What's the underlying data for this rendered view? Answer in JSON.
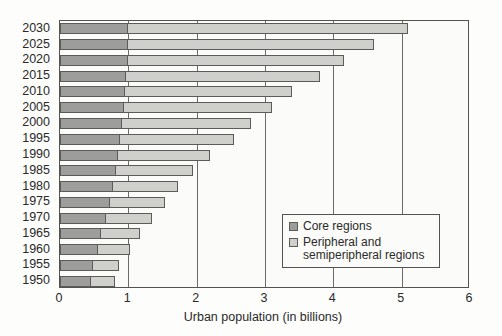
{
  "chart_data": {
    "type": "bar",
    "orientation": "horizontal",
    "stacked": true,
    "title": "",
    "xlabel": "Urban population (in billions)",
    "ylabel": "",
    "xlim": [
      0,
      6
    ],
    "xticks": [
      "0",
      "1",
      "2",
      "3",
      "4",
      "5",
      "6"
    ],
    "grid": true,
    "legend_position": "inside-lower-right",
    "categories": [
      "2030",
      "2025",
      "2020",
      "2015",
      "2010",
      "2005",
      "2000",
      "1995",
      "1990",
      "1985",
      "1980",
      "1975",
      "1970",
      "1965",
      "1960",
      "1955",
      "1950"
    ],
    "series": [
      {
        "name": "Core regions",
        "color": "#9d9d9b",
        "values": [
          1.0,
          1.0,
          0.99,
          0.97,
          0.95,
          0.93,
          0.9,
          0.88,
          0.85,
          0.82,
          0.78,
          0.73,
          0.67,
          0.6,
          0.55,
          0.48,
          0.45
        ]
      },
      {
        "name": "Peripheral and semiperipheral regions",
        "color": "#cfcfcb",
        "values": [
          4.1,
          3.6,
          3.16,
          2.83,
          2.45,
          2.17,
          1.9,
          1.67,
          1.35,
          1.13,
          0.95,
          0.8,
          0.68,
          0.57,
          0.47,
          0.39,
          0.35
        ]
      }
    ],
    "totals": [
      5.1,
      4.6,
      4.15,
      3.8,
      3.4,
      3.1,
      2.8,
      2.55,
      2.2,
      1.95,
      1.73,
      1.53,
      1.35,
      1.17,
      1.02,
      0.87,
      0.8
    ]
  },
  "legend": {
    "entries": [
      {
        "label": "Core regions"
      },
      {
        "label": "Peripheral and semiperipheral regions"
      }
    ]
  }
}
